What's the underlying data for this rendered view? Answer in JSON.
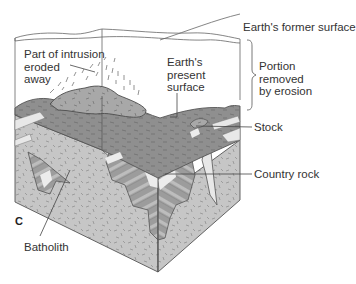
{
  "figure": {
    "panel_letter": "C",
    "colors": {
      "background": "#ffffff",
      "outline": "#555555",
      "intrusion_fill": "#a9a9a9",
      "country_rock_light": "#c4c4c4",
      "country_rock_mid": "#9a9a9a",
      "strata_light": "#e6e6e6",
      "surface_fill": "#8f8f8f",
      "label_text": "#333333"
    }
  },
  "labels": {
    "former_surface": "Earth's former surface",
    "eroded_intrusion": [
      "Part of intrusion",
      "eroded",
      "away"
    ],
    "present_surface": [
      "Earth's",
      "present",
      "surface"
    ],
    "portion_removed": [
      "Portion",
      "removed",
      "by erosion"
    ],
    "stock": "Stock",
    "country_rock": "Country rock",
    "batholith": "Batholith"
  }
}
